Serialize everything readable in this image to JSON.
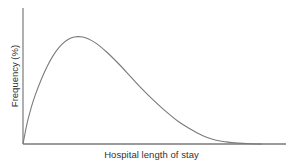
{
  "chart_data": {
    "type": "line",
    "title": "",
    "xlabel": "Hospital length of stay",
    "ylabel": "Frequency (%)",
    "x_ticks": [],
    "y_ticks": [],
    "grid": false,
    "legend": null,
    "series": [
      {
        "name": "distribution",
        "color": "#7a7a7a",
        "x_relative": [
          0.0,
          0.02,
          0.05,
          0.1,
          0.15,
          0.2,
          0.25,
          0.3,
          0.35,
          0.4,
          0.45,
          0.5,
          0.55,
          0.6,
          0.65,
          0.7,
          0.75,
          0.8,
          0.85,
          0.9,
          0.95,
          1.0
        ],
        "y_relative": [
          0.0,
          0.22,
          0.45,
          0.72,
          0.9,
          0.99,
          1.0,
          0.95,
          0.86,
          0.75,
          0.63,
          0.51,
          0.4,
          0.3,
          0.21,
          0.14,
          0.08,
          0.04,
          0.02,
          0.008,
          0.002,
          0.0
        ]
      }
    ],
    "xlim": [
      0,
      1
    ],
    "ylim": [
      0,
      1.15
    ]
  },
  "colors": {
    "axis": "#7a7a7a",
    "curve": "#7a7a7a",
    "text": "#333333"
  }
}
